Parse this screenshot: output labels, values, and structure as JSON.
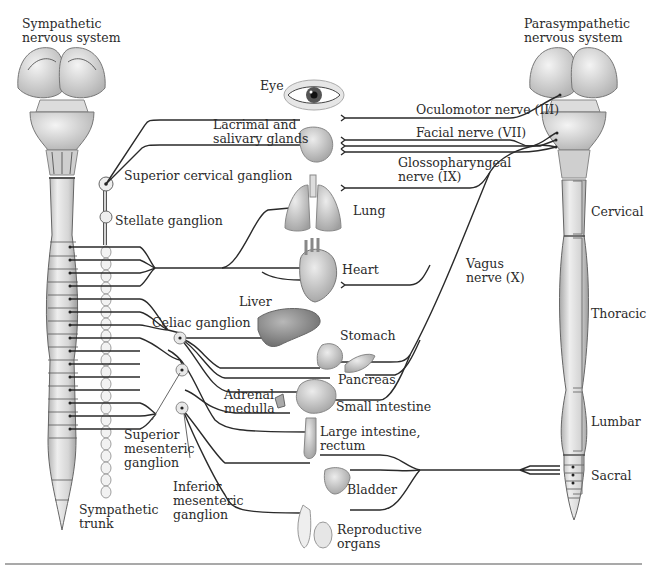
{
  "diagram": {
    "title_left": "Sympathetic nervous system",
    "title_right": "Parasympathetic nervous system",
    "sympathetic": {
      "title": [
        "Sympathetic",
        "nervous system"
      ],
      "ganglia": {
        "superior_cervical": "Superior cervical ganglion",
        "stellate": "Stellate ganglion",
        "celiac": "Celiac ganglion",
        "superior_mesenteric": [
          "Superior",
          "mesenteric",
          "ganglion"
        ],
        "inferior_mesenteric": [
          "Inferior",
          "mesenteric",
          "ganglion"
        ]
      },
      "trunk": [
        "Sympathetic",
        "trunk"
      ]
    },
    "parasympathetic": {
      "title": [
        "Parasympathetic",
        "nervous system"
      ],
      "nerves": {
        "oculomotor": "Oculomotor nerve (III)",
        "facial": "Facial nerve (VII)",
        "glossopharyngeal": [
          "Glossopharyngeal",
          "nerve (IX)"
        ],
        "vagus": [
          "Vagus",
          "nerve (X)"
        ]
      },
      "spinal_regions": [
        "Cervical",
        "Thoracic",
        "Lumbar",
        "Sacral"
      ]
    },
    "organs": {
      "eye": "Eye",
      "lacrimal": [
        "Lacrimal and",
        "salivary glands"
      ],
      "lung": "Lung",
      "heart": "Heart",
      "liver": "Liver",
      "stomach": "Stomach",
      "pancreas": "Pancreas",
      "adrenal": [
        "Adrenal",
        "medulla"
      ],
      "small_intestine": "Small intestine",
      "large_intestine": [
        "Large intestine,",
        "rectum"
      ],
      "bladder": "Bladder",
      "reproductive": [
        "Reproductive",
        "organs"
      ]
    },
    "colors": {
      "nerve": "#2a2a2a",
      "tissue": "#d9d9d9",
      "tissue_dark": "#9a9a9a",
      "background": "#ffffff"
    }
  }
}
